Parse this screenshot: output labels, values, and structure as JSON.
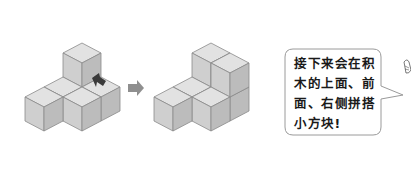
{
  "colors": {
    "top_face": "#e2e2e2",
    "left_face": "#cfcfcf",
    "right_face": "#bcbcbc",
    "edge": "#8a8a8a",
    "arrow": "#8f8f8f",
    "insert_arrow": "#3a3a3a",
    "bubble_border": "#9a9a9a",
    "text": "#1a1a1a"
  },
  "iso": {
    "w": 19,
    "h": 10,
    "v": 24
  },
  "figures": [
    {
      "name": "before",
      "origin": [
        82,
        67
      ],
      "cubes": [
        [
          0,
          0,
          0
        ],
        [
          0,
          0,
          1
        ],
        [
          1,
          0,
          0
        ],
        [
          0,
          1,
          0
        ],
        [
          1,
          1,
          0
        ],
        [
          0,
          2,
          0
        ]
      ]
    },
    {
      "name": "after",
      "origin": [
        211,
        67
      ],
      "cubes": [
        [
          0,
          0,
          0
        ],
        [
          0,
          0,
          1
        ],
        [
          1,
          0,
          0
        ],
        [
          1,
          0,
          1
        ],
        [
          0,
          1,
          0
        ],
        [
          1,
          1,
          0
        ],
        [
          0,
          2,
          0
        ]
      ]
    }
  ],
  "speech_bubble": {
    "lines": [
      "接下来会在积",
      "木的上面、前",
      "面、右侧拼搭",
      "小方块!"
    ]
  }
}
